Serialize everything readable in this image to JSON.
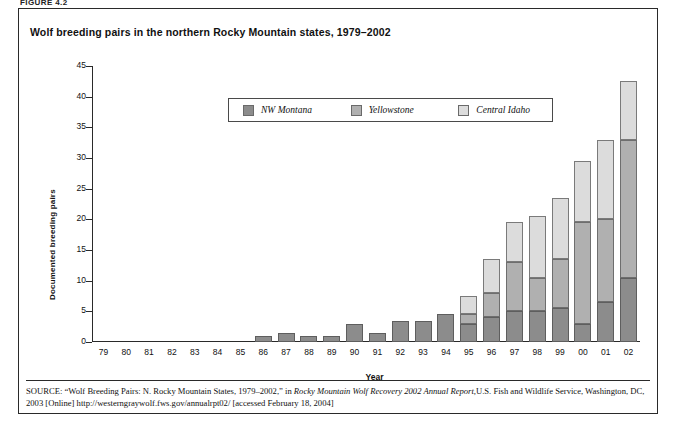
{
  "figure": {
    "label": "FIGURE 4.2",
    "title": "Wolf breeding pairs in the northern Rocky Mountain states, 1979–2002"
  },
  "legend": {
    "position": "top-center",
    "items": [
      {
        "label": "NW Montana",
        "color": "#8c8c8c"
      },
      {
        "label": "Yellowstone",
        "color": "#b0b0b0"
      },
      {
        "label": "Central Idaho",
        "color": "#dcdcdc"
      }
    ]
  },
  "source": {
    "prefix": "SOURCE:",
    "text_1": "“Wolf Breeding Pairs: N. Rocky Mountain States, 1979–2002,” in ",
    "italic_1": "Rocky Mountain Wolf Recovery 2002 Annual Report,",
    "text_2": "U.S. Fish and Wildlife Service, Washington, DC, 2003 [Online] http://westerngraywolf.fws.gov/annualrpt02/ [accessed February 18, 2004]"
  },
  "chart_data": {
    "type": "bar",
    "stacked": true,
    "title": "Wolf breeding pairs in the northern Rocky Mountain states, 1979–2002",
    "xlabel": "Year",
    "ylabel": "Documented breeding pairs",
    "ylim": [
      0,
      45
    ],
    "yticks": [
      0,
      5,
      10,
      15,
      20,
      25,
      30,
      35,
      40,
      45
    ],
    "grid": false,
    "legend_position": "top-center",
    "categories": [
      "79",
      "80",
      "81",
      "82",
      "83",
      "84",
      "85",
      "86",
      "87",
      "88",
      "89",
      "90",
      "91",
      "92",
      "93",
      "94",
      "95",
      "96",
      "97",
      "98",
      "99",
      "00",
      "01",
      "02"
    ],
    "series": [
      {
        "name": "NW Montana",
        "color": "#8c8c8c",
        "values": [
          0,
          0,
          0,
          0,
          0,
          0,
          0,
          1,
          1.5,
          1,
          1,
          3,
          1.5,
          3.5,
          3.5,
          4.5,
          3,
          4,
          5,
          5,
          5.5,
          3,
          6.5,
          10.5
        ]
      },
      {
        "name": "Yellowstone",
        "color": "#b0b0b0",
        "values": [
          0,
          0,
          0,
          0,
          0,
          0,
          0,
          0,
          0,
          0,
          0,
          0,
          0,
          0,
          0,
          0,
          1.5,
          4,
          8,
          5.5,
          8,
          16.5,
          13.5,
          22.5
        ]
      },
      {
        "name": "Central Idaho",
        "color": "#dcdcdc",
        "values": [
          0,
          0,
          0,
          0,
          0,
          0,
          0,
          0,
          0,
          0,
          0,
          0,
          0,
          0,
          0,
          0,
          3,
          5.5,
          6.5,
          10,
          10,
          10,
          13,
          9.5
        ]
      }
    ],
    "totals": [
      0,
      0,
      0,
      0,
      0,
      0,
      0,
      1,
      1.5,
      1,
      1,
      3,
      1.5,
      3.5,
      3.5,
      4.5,
      7.5,
      13.5,
      19.5,
      20.5,
      23.5,
      29.5,
      33,
      42.5
    ]
  }
}
